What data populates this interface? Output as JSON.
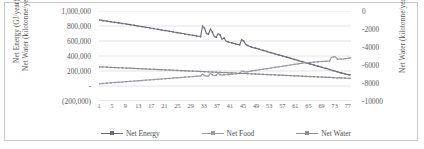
{
  "chart_data": {
    "type": "line",
    "title": "",
    "xlabel": "",
    "ylabel": "Net Energy (GJ/year)\nNet Water (kilotonne/year)",
    "y_left_title_line1": "Net Energy (GJ/year)",
    "y_left_title_line2": "Net Water (kilotonne/year)",
    "y_right_title": "Net Water (kilotonne/year)",
    "grid": true,
    "legend_position": "bottom",
    "ylim": [
      -200000,
      1000000
    ],
    "y2lim": [
      -10000,
      0
    ],
    "yticks": [
      "1,000,000",
      "800,000",
      "600,000",
      "400,000",
      "200,000",
      "-",
      "(200,000)"
    ],
    "ytick_values": [
      1000000,
      800000,
      600000,
      400000,
      200000,
      0,
      -200000
    ],
    "y2ticks": [
      "0",
      "-2000",
      "-4000",
      "-6000",
      "-8000",
      "-10000"
    ],
    "y2tick_values": [
      0,
      -2000,
      -4000,
      -6000,
      -8000,
      -10000
    ],
    "xticks": [
      "1",
      "5",
      "9",
      "13",
      "17",
      "21",
      "25",
      "29",
      "33",
      "37",
      "41",
      "45",
      "49",
      "53",
      "57",
      "61",
      "65",
      "69",
      "73",
      "77"
    ],
    "xlim": [
      1,
      78
    ],
    "series": [
      {
        "name": "Net Energy",
        "axis": "left",
        "color": "#6b6b78",
        "values": [
          880000,
          878000,
          872000,
          869000,
          866000,
          860000,
          858000,
          852000,
          849000,
          845000,
          842000,
          838000,
          833000,
          830000,
          826000,
          822000,
          818000,
          814000,
          810000,
          805000,
          800000,
          796000,
          792000,
          788000,
          783000,
          779000,
          774000,
          770000,
          766000,
          761000,
          757000,
          752000,
          748000,
          744000,
          739000,
          735000,
          730000,
          726000,
          721000,
          717000,
          712000,
          708000,
          703000,
          699000,
          694000,
          690000,
          685000,
          681000,
          676000,
          672000,
          667000,
          663000,
          658000,
          800000,
          770000,
          700000,
          690000,
          760000,
          720000,
          660000,
          650000,
          700000,
          680000,
          620000,
          640000,
          600000,
          590000,
          580000,
          575000,
          568000,
          560000,
          555000,
          548000,
          620000,
          600000,
          560000,
          540000,
          530000,
          520000,
          512000,
          505000,
          498000,
          490000,
          482000,
          475000,
          468000,
          460000,
          452000,
          445000,
          438000,
          430000,
          422000,
          415000,
          408000,
          400000,
          392000,
          385000,
          378000,
          370000,
          362000,
          355000,
          348000,
          340000,
          332000,
          325000,
          318000,
          310000,
          302000,
          295000,
          288000,
          280000,
          272000,
          265000,
          258000,
          250000,
          242000,
          235000,
          228000,
          220000,
          212000,
          205000,
          198000,
          190000,
          182000,
          175000,
          168000,
          160000,
          155000,
          150000,
          148000
        ]
      },
      {
        "name": "Net Food",
        "axis": "left",
        "color": "#9a9aa5",
        "values": [
          30000,
          32000,
          34000,
          36000,
          38000,
          40000,
          42000,
          44000,
          46000,
          48000,
          50000,
          52000,
          54000,
          56000,
          58000,
          60000,
          62000,
          64000,
          66000,
          68000,
          70000,
          72000,
          74000,
          76000,
          78000,
          80000,
          82000,
          84000,
          86000,
          88000,
          90000,
          92000,
          94000,
          96000,
          98000,
          100000,
          102000,
          104000,
          106000,
          108000,
          110000,
          112000,
          114000,
          116000,
          118000,
          120000,
          122000,
          124000,
          126000,
          128000,
          130000,
          132000,
          134000,
          160000,
          140000,
          132000,
          135000,
          168000,
          150000,
          138000,
          142000,
          170000,
          152000,
          145000,
          148000,
          150000,
          152000,
          155000,
          158000,
          160000,
          163000,
          165000,
          168000,
          200000,
          195000,
          185000,
          190000,
          195000,
          200000,
          205000,
          208000,
          212000,
          216000,
          220000,
          224000,
          228000,
          232000,
          236000,
          240000,
          244000,
          248000,
          252000,
          256000,
          260000,
          264000,
          268000,
          272000,
          276000,
          280000,
          284000,
          288000,
          292000,
          296000,
          300000,
          304000,
          308000,
          310000,
          312000,
          314000,
          316000,
          318000,
          320000,
          322000,
          324000,
          326000,
          328000,
          330000,
          332000,
          334000,
          380000,
          390000,
          388000,
          360000,
          358000,
          360000,
          362000,
          365000,
          368000,
          372000,
          378000
        ]
      },
      {
        "name": "Net Water",
        "axis": "right",
        "color": "#8e8e8e",
        "values": [
          -6200,
          -6210,
          -6220,
          -6230,
          -6240,
          -6250,
          -6260,
          -6270,
          -6280,
          -6290,
          -6300,
          -6310,
          -6320,
          -6330,
          -6340,
          -6350,
          -6360,
          -6370,
          -6380,
          -6390,
          -6400,
          -6410,
          -6420,
          -6430,
          -6440,
          -6450,
          -6460,
          -6470,
          -6480,
          -6490,
          -6500,
          -6510,
          -6520,
          -6530,
          -6540,
          -6550,
          -6560,
          -6570,
          -6580,
          -6590,
          -6600,
          -6610,
          -6620,
          -6630,
          -6640,
          -6650,
          -6660,
          -6670,
          -6680,
          -6690,
          -6700,
          -6710,
          -6720,
          -6730,
          -6740,
          -6750,
          -6760,
          -6770,
          -6780,
          -6790,
          -6800,
          -6810,
          -6820,
          -6830,
          -6840,
          -6850,
          -6860,
          -6870,
          -6880,
          -6890,
          -6900,
          -6910,
          -6920,
          -6930,
          -6940,
          -6950,
          -6960,
          -6970,
          -6980,
          -6990,
          -7000,
          -7010,
          -7020,
          -7030,
          -7040,
          -7050,
          -7060,
          -7070,
          -7080,
          -7090,
          -7100,
          -7110,
          -7120,
          -7130,
          -7140,
          -7150,
          -7160,
          -7170,
          -7180,
          -7190,
          -7200,
          -7210,
          -7220,
          -7230,
          -7240,
          -7250,
          -7260,
          -7270,
          -7280,
          -7290,
          -7300,
          -7310,
          -7320,
          -7330,
          -7340,
          -7350,
          -7360,
          -7370,
          -7380,
          -7390,
          -7400,
          -7410,
          -7420,
          -7430,
          -7440,
          -7450,
          -7460,
          -7470,
          -7480,
          -7490
        ]
      }
    ]
  },
  "legend": {
    "items": [
      {
        "label": "Net Energy"
      },
      {
        "label": "Net Food"
      },
      {
        "label": "Net Water"
      }
    ]
  }
}
